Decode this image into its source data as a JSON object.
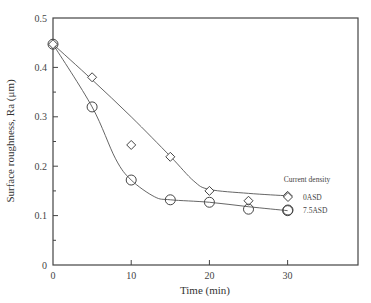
{
  "chart_data": {
    "type": "scatter",
    "title": "",
    "xlabel": "Time (min)",
    "ylabel": "Surface roughness, Ra (μm)",
    "xlim": [
      0,
      39
    ],
    "ylim": [
      0,
      0.5
    ],
    "xticks": [
      0,
      10,
      20,
      30
    ],
    "yticks": [
      0,
      0.1,
      0.2,
      0.3,
      0.4,
      0.5
    ],
    "ytick_labels": [
      "0",
      "0.1",
      "0.2",
      "0.3",
      "0.4",
      "0.5"
    ],
    "xtick_labels": [
      "0",
      "10",
      "20",
      "30"
    ],
    "grid": false,
    "legend_title": "Current density",
    "legend_position": "inside right, mid-lower",
    "series": [
      {
        "name": "0ASD",
        "marker": "diamond",
        "x": [
          0,
          5,
          10,
          15,
          20,
          25,
          30
        ],
        "y": [
          0.447,
          0.38,
          0.243,
          0.219,
          0.15,
          0.13,
          0.14
        ],
        "fit_curve": [
          [
            0,
            0.447
          ],
          [
            5,
            0.375
          ],
          [
            10,
            0.3
          ],
          [
            15,
            0.22
          ],
          [
            18,
            0.17
          ],
          [
            20,
            0.153
          ],
          [
            25,
            0.145
          ],
          [
            30,
            0.14
          ]
        ]
      },
      {
        "name": "7.5ASD",
        "marker": "circle",
        "x": [
          0,
          5,
          10,
          15,
          20,
          25,
          30
        ],
        "y": [
          0.447,
          0.32,
          0.172,
          0.132,
          0.127,
          0.113,
          0.11
        ],
        "fit_curve": [
          [
            0,
            0.447
          ],
          [
            5,
            0.32
          ],
          [
            8,
            0.215
          ],
          [
            10,
            0.172
          ],
          [
            13,
            0.138
          ],
          [
            15,
            0.132
          ],
          [
            20,
            0.127
          ],
          [
            25,
            0.118
          ],
          [
            30,
            0.11
          ]
        ]
      }
    ]
  }
}
